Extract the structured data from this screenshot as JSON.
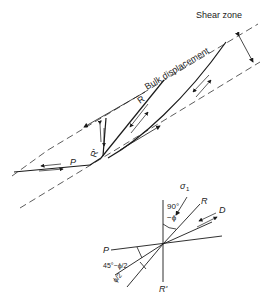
{
  "diagram": {
    "title": "Shear zone",
    "labels": {
      "shear_zone": "Shear zone",
      "bulk_displacement": "Bulk displacement",
      "R": "R",
      "R_prime": "R'",
      "P": "P"
    },
    "stress_diagram": {
      "sigma": "σ",
      "sigma_sub": "1",
      "angle_90": "90°",
      "angle_minus_phi": "−ϕ",
      "R": "R",
      "D": "D",
      "P": "P",
      "R_prime": "R'",
      "angle_45": "45°−ϕ/2",
      "angle_phi2": "ϕ/2"
    },
    "colors": {
      "line": "#1a1a1a",
      "background": "#ffffff"
    }
  }
}
